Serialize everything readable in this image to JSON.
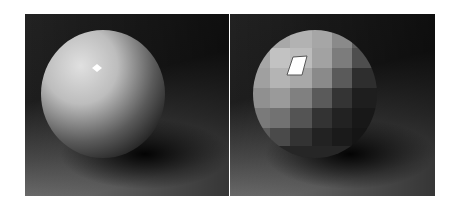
{
  "figure": {
    "background": "#ffffff",
    "panels": [
      {
        "id": "smooth-shading",
        "description": "Smoothly shaded sphere with specular highlight on dark backdrop",
        "sphere_color": "#c8c8c8",
        "highlight_color": "#ffffff",
        "backdrop_top": "#1a1a1a",
        "floor_color": "#6e6e6e"
      },
      {
        "id": "flat-shading",
        "description": "Faceted (flat-shaded) sphere with per-facet highlight on dark backdrop",
        "sphere_color": "#b8b8b8",
        "highlight_color": "#ffffff",
        "backdrop_top": "#1a1a1a",
        "floor_color": "#6e6e6e"
      }
    ]
  }
}
